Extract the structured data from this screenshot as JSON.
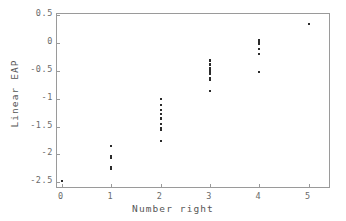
{
  "chart_data": {
    "type": "scatter",
    "title": "",
    "xlabel": "Number right",
    "ylabel": "Linear EAP",
    "xlim": [
      -0.1,
      5.45
    ],
    "ylim": [
      -2.62,
      0.52
    ],
    "grid": false,
    "legend": null,
    "xticks": [
      0,
      1,
      2,
      3,
      4,
      5
    ],
    "xtick_labels": [
      "0",
      "1",
      "2",
      "3",
      "4",
      "5"
    ],
    "yticks": [
      0.5,
      0,
      -0.5,
      -1,
      -1.5,
      -2,
      -2.5
    ],
    "ytick_labels": [
      "0.5",
      "0",
      "-0.5",
      "-1",
      "-1.5",
      "-2",
      "-2.5"
    ],
    "marker": "point",
    "marker_color": "#2b2b2b",
    "frame_color": "#9a9a9a",
    "background_color": "#ffffff",
    "points": [
      {
        "x": 0,
        "y": -2.48
      },
      {
        "x": 1,
        "y": -1.84
      },
      {
        "x": 1,
        "y": -2.02
      },
      {
        "x": 1,
        "y": -2.07
      },
      {
        "x": 1,
        "y": -2.22
      },
      {
        "x": 1,
        "y": -2.26
      },
      {
        "x": 2,
        "y": -1.0
      },
      {
        "x": 2,
        "y": -1.12
      },
      {
        "x": 2,
        "y": -1.2
      },
      {
        "x": 2,
        "y": -1.28
      },
      {
        "x": 2,
        "y": -1.35
      },
      {
        "x": 2,
        "y": -1.36
      },
      {
        "x": 2,
        "y": -1.46
      },
      {
        "x": 2,
        "y": -1.52
      },
      {
        "x": 2,
        "y": -1.56
      },
      {
        "x": 2,
        "y": -1.75
      },
      {
        "x": 3,
        "y": -0.3
      },
      {
        "x": 3,
        "y": -0.32
      },
      {
        "x": 3,
        "y": -0.38
      },
      {
        "x": 3,
        "y": -0.4
      },
      {
        "x": 3,
        "y": -0.44
      },
      {
        "x": 3,
        "y": -0.46
      },
      {
        "x": 3,
        "y": -0.48
      },
      {
        "x": 3,
        "y": -0.5
      },
      {
        "x": 3,
        "y": -0.54
      },
      {
        "x": 3,
        "y": -0.56
      },
      {
        "x": 3,
        "y": -0.62
      },
      {
        "x": 3,
        "y": -0.66
      },
      {
        "x": 3,
        "y": -0.87
      },
      {
        "x": 4,
        "y": 0.05
      },
      {
        "x": 4,
        "y": 0.03
      },
      {
        "x": 4,
        "y": 0.0
      },
      {
        "x": 4,
        "y": -0.02
      },
      {
        "x": 4,
        "y": -0.1
      },
      {
        "x": 4,
        "y": -0.2
      },
      {
        "x": 4,
        "y": -0.52
      },
      {
        "x": 5,
        "y": 0.34
      }
    ]
  }
}
